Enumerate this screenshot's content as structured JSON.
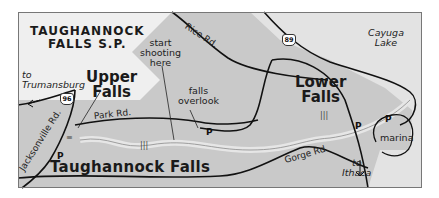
{
  "map": {
    "title_line1": "TAUGHANNOCK",
    "title_line2": "FALLS S.P.",
    "colors": {
      "land": "#c9c9c9",
      "light_area": "#efefef",
      "lake": "#e3e3e3",
      "creek": "#e6e6e6",
      "road": "#111111",
      "border": "#777777"
    },
    "labels": {
      "upper_falls_line1": "Upper",
      "upper_falls_line2": "Falls",
      "lower_falls_line1": "Lower",
      "lower_falls_line2": "Falls",
      "taughannock_falls": "Taughannock Falls",
      "start_shooting_line1": "start",
      "start_shooting_line2": "shooting",
      "start_shooting_line3": "here",
      "falls_overlook_line1": "falls",
      "falls_overlook_line2": "overlook",
      "to_trumansburg_line1": "to",
      "to_trumansburg_line2": "Trumansburg",
      "to_ithaca_line1": "to",
      "to_ithaca_line2": "Ithaca",
      "cayuga_lake_line1": "Cayuga",
      "cayuga_lake_line2": "Lake",
      "marina": "marina"
    },
    "roads": {
      "rice_rd": "Rice Rd.",
      "park_rd": "Park Rd.",
      "jacksonville_rd": "Jacksonville Rd.",
      "gorge_rd": "Gorge Rd."
    },
    "route_shields": {
      "route_96": "96",
      "route_89": "89"
    },
    "parking": {
      "symbol": "P",
      "count": 4
    }
  }
}
